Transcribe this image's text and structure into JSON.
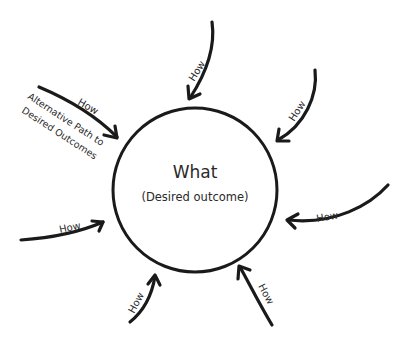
{
  "diagram": {
    "center": {
      "title": "What",
      "subtitle": "(Desired outcome)"
    },
    "arrows": [
      {
        "id": "top",
        "label": "How"
      },
      {
        "id": "top-right",
        "label": "How"
      },
      {
        "id": "right",
        "label": "How"
      },
      {
        "id": "bottom-right",
        "label": "How"
      },
      {
        "id": "bottom-left",
        "label": "How"
      },
      {
        "id": "left",
        "label": "How"
      },
      {
        "id": "top-left",
        "label": "How"
      }
    ],
    "annotation": {
      "line1": "Alternative Path to",
      "line2": "Desired Outcomes"
    }
  }
}
